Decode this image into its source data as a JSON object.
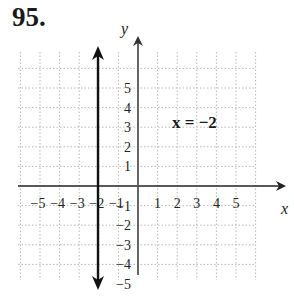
{
  "problem_number": "95.",
  "chart_data": {
    "type": "line",
    "title": "",
    "xlabel": "x",
    "ylabel": "y",
    "xlim": [
      -6,
      7
    ],
    "ylim": [
      -6,
      7
    ],
    "grid": true,
    "x_ticks": [
      "-5",
      "-4",
      "-3",
      "-2",
      "-1",
      "1",
      "2",
      "3",
      "4",
      "5"
    ],
    "y_ticks": [
      "5",
      "4",
      "3",
      "2",
      "1",
      "-1",
      "-2",
      "-3",
      "-4",
      "-5"
    ],
    "series": [
      {
        "name": "x = -2",
        "type": "vertical-line",
        "x": -2,
        "y_range": [
          -6,
          6
        ],
        "arrows": "both"
      }
    ],
    "annotations": [
      {
        "text": "x = −2",
        "x": 2,
        "y": 2.5
      }
    ]
  },
  "labels": {
    "x_axis": "x",
    "y_axis": "y",
    "equation": "x = −2",
    "x_neg": [
      "−5",
      "−4",
      "−3",
      "−2",
      "−1"
    ],
    "x_pos": [
      "1",
      "2",
      "3",
      "4",
      "5"
    ],
    "y_pos": [
      "5",
      "4",
      "3",
      "2",
      "1"
    ],
    "y_neg": [
      "−1",
      "−2",
      "−3",
      "−4",
      "−5"
    ]
  }
}
